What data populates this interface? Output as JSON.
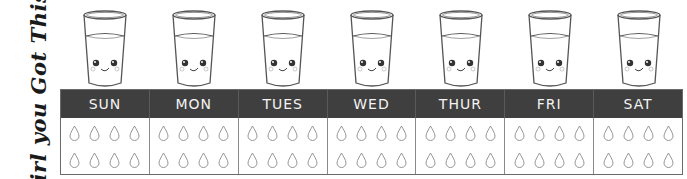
{
  "slogan": "Girl you Got This!",
  "colors": {
    "header_bg": "#3f3f3f",
    "header_text": "#f3f3f3",
    "border": "#6a6a6a",
    "drop_outline": "#8a8a8a",
    "glass_outline": "#555555"
  },
  "icons": {
    "glass": "smiling-water-glass-icon",
    "drop": "water-drop-outline-icon"
  },
  "drops_per_day": 8,
  "days": [
    {
      "label": "SUN"
    },
    {
      "label": "MON"
    },
    {
      "label": "TUES"
    },
    {
      "label": "WED"
    },
    {
      "label": "THUR"
    },
    {
      "label": "FRI"
    },
    {
      "label": "SAT"
    }
  ]
}
